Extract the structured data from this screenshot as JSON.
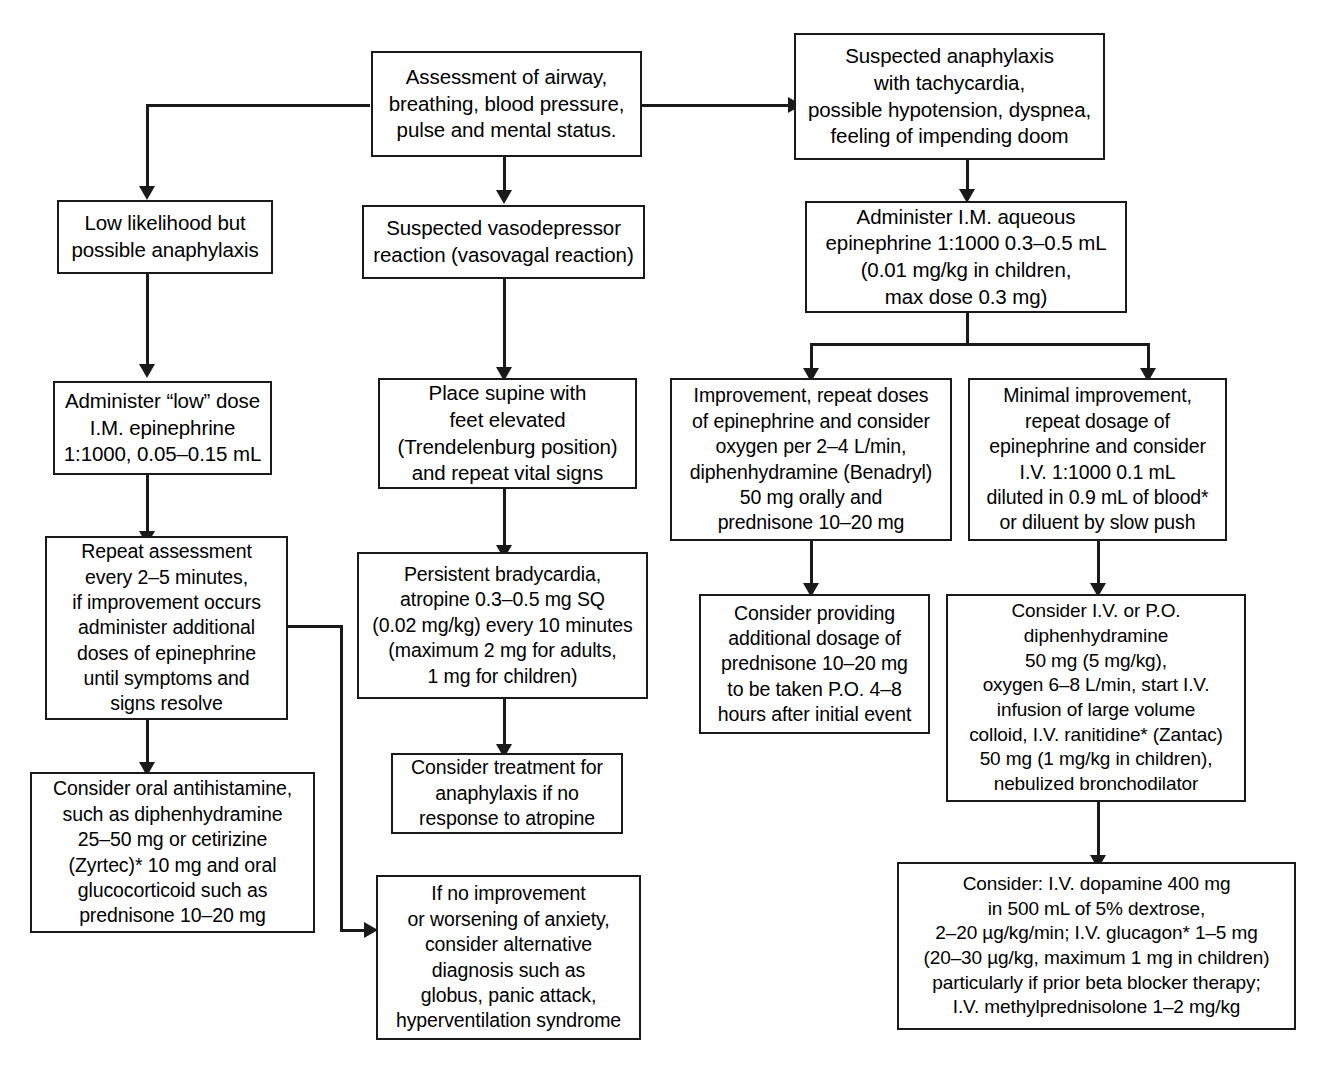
{
  "diagram": {
    "line_color": "#1a1a1a",
    "box_fill": "#ffffff",
    "nodes": {
      "assessment": "Assessment of airway,\nbreathing, blood pressure,\npulse and mental status.",
      "suspected_anaphylaxis": "Suspected anaphylaxis\nwith tachycardia,\npossible hypotension, dyspnea,\nfeeling of impending doom",
      "low_likelihood": "Low likelihood but\npossible anaphylaxis",
      "suspected_vasodepressor": "Suspected vasodepressor\nreaction (vasovagal reaction)",
      "administer_im_aqueous": "Administer I.M. aqueous\nepinephrine 1:1000 0.3–0.5 mL\n(0.01 mg/kg in children,\nmax dose 0.3 mg)",
      "administer_low_dose": "Administer “low” dose\nI.M. epinephrine\n1:1000, 0.05–0.15 mL",
      "place_supine": "Place supine with\nfeet elevated\n(Trendelenburg position)\nand repeat vital signs",
      "improvement": "Improvement, repeat doses\nof epinephrine and consider\noxygen per 2–4 L/min,\ndiphenhydramine (Benadryl)\n50 mg orally and\nprednisone 10–20 mg",
      "minimal_improvement": "Minimal improvement,\nrepeat dosage of\nepinephrine and consider\nI.V. 1:1000 0.1 mL\ndiluted in 0.9 mL of blood*\nor diluent by slow push",
      "repeat_assessment": "Repeat assessment\nevery 2–5 minutes,\nif improvement occurs\nadminister additional\ndoses of epinephrine\nuntil symptoms and\nsigns resolve",
      "persistent_bradycardia": "Persistent bradycardia,\natropine 0.3–0.5 mg SQ\n(0.02 mg/kg) every 10 minutes\n(maximum 2 mg for adults,\n1 mg for children)",
      "consider_providing": "Consider providing\nadditional dosage of\nprednisone 10–20 mg\nto be taken P.O. 4–8\nhours after initial event",
      "consider_iv_po": "Consider I.V. or P.O.\ndiphenhydramine\n50 mg (5 mg/kg),\noxygen 6–8 L/min, start I.V.\ninfusion of large volume\ncolloid, I.V. ranitidine* (Zantac)\n50 mg (1 mg/kg in children),\nnebulized bronchodilator",
      "consider_treatment": "Consider treatment for\nanaphylaxis if no\nresponse to atropine",
      "consider_oral_antihistamine": "Consider oral antihistamine,\nsuch as diphenhydramine\n25–50 mg or cetirizine\n(Zyrtec)* 10 mg and oral\nglucocorticoid such as\nprednisone 10–20 mg",
      "no_improvement": "If no improvement\nor worsening of anxiety,\nconsider alternative\ndiagnosis such as\nglobus, panic attack,\nhyperventilation syndrome",
      "consider_dopamine": "Consider: I.V. dopamine 400 mg\nin 500 mL of 5% dextrose,\n2–20 µg/kg/min; I.V. glucagon* 1–5 mg\n(20–30 µg/kg, maximum 1 mg in children)\nparticularly if prior beta blocker therapy;\nI.V. methylprednisolone 1–2 mg/kg"
    }
  }
}
